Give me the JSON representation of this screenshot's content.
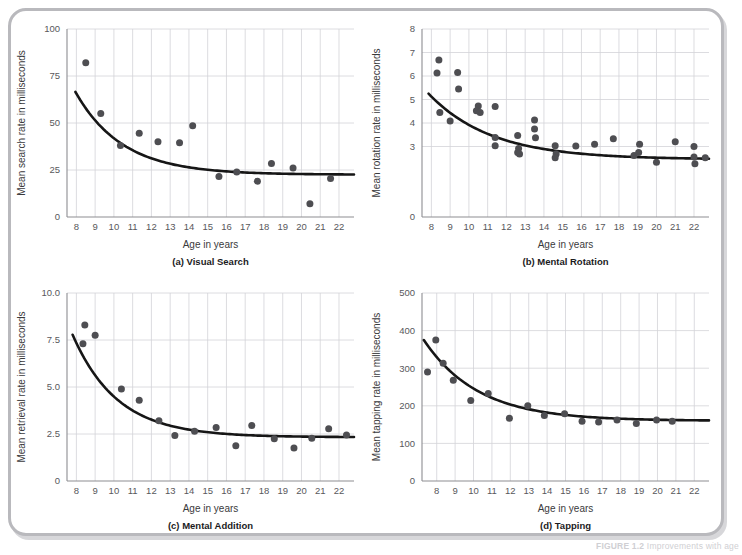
{
  "figure": {
    "caption_label": "FIGURE 1.2",
    "caption_rest": "  Improvements with age"
  },
  "common": {
    "xlabel": "Age in years",
    "xticks": [
      8,
      9,
      10,
      11,
      12,
      13,
      14,
      15,
      16,
      17,
      18,
      19,
      20,
      21,
      22
    ],
    "xlim": [
      7.5,
      22.8
    ]
  },
  "chart_data": [
    {
      "id": "visual-search",
      "type": "scatter",
      "title": "(a) Visual Search",
      "xlabel": "Age in years",
      "ylabel": "Mean search rate in milliseconds",
      "xlim": [
        7.5,
        22.8
      ],
      "ylim": [
        0,
        100
      ],
      "yticks": [
        0,
        25,
        50,
        75,
        100
      ],
      "ytick_labels": [
        "0",
        "25",
        "50",
        "75",
        "100"
      ],
      "grid": true,
      "points": [
        {
          "x": 8.5,
          "y": 82
        },
        {
          "x": 9.3,
          "y": 55
        },
        {
          "x": 10.35,
          "y": 38
        },
        {
          "x": 11.35,
          "y": 44.5
        },
        {
          "x": 12.35,
          "y": 40
        },
        {
          "x": 13.5,
          "y": 39.5
        },
        {
          "x": 14.2,
          "y": 48.5
        },
        {
          "x": 15.6,
          "y": 21.5
        },
        {
          "x": 16.55,
          "y": 24
        },
        {
          "x": 17.65,
          "y": 19
        },
        {
          "x": 18.4,
          "y": 28.5
        },
        {
          "x": 19.55,
          "y": 26
        },
        {
          "x": 20.45,
          "y": 7
        },
        {
          "x": 21.55,
          "y": 20.5
        }
      ],
      "fit": {
        "asymptote": 22.5,
        "amplitude": 44.0,
        "rate": 0.4,
        "x0": 7.95
      }
    },
    {
      "id": "mental-rotation",
      "type": "scatter",
      "title": "(b) Mental Rotation",
      "xlabel": "Age in years",
      "ylabel": "Mean rotation rate in milliseconds",
      "xlim": [
        7.5,
        22.8
      ],
      "ylim": [
        0,
        8
      ],
      "yticks": [
        0,
        3,
        4,
        5,
        6,
        7,
        8
      ],
      "ytick_labels": [
        "0",
        "3",
        "4",
        "5",
        "6",
        "7",
        "8"
      ],
      "grid": true,
      "points": [
        {
          "x": 8.4,
          "y": 6.68
        },
        {
          "x": 8.3,
          "y": 6.13
        },
        {
          "x": 9.4,
          "y": 6.15
        },
        {
          "x": 9.45,
          "y": 5.45
        },
        {
          "x": 8.45,
          "y": 4.45
        },
        {
          "x": 9.0,
          "y": 4.08
        },
        {
          "x": 10.5,
          "y": 4.72
        },
        {
          "x": 10.4,
          "y": 4.52
        },
        {
          "x": 10.6,
          "y": 4.45
        },
        {
          "x": 11.4,
          "y": 4.7
        },
        {
          "x": 11.4,
          "y": 3.38
        },
        {
          "x": 11.4,
          "y": 3.03
        },
        {
          "x": 12.6,
          "y": 3.47
        },
        {
          "x": 12.65,
          "y": 2.92
        },
        {
          "x": 12.6,
          "y": 2.75
        },
        {
          "x": 12.7,
          "y": 2.68
        },
        {
          "x": 13.5,
          "y": 4.13
        },
        {
          "x": 13.5,
          "y": 3.75
        },
        {
          "x": 13.55,
          "y": 3.37
        },
        {
          "x": 14.6,
          "y": 3.03
        },
        {
          "x": 14.65,
          "y": 2.68
        },
        {
          "x": 14.6,
          "y": 2.52
        },
        {
          "x": 15.7,
          "y": 3.02
        },
        {
          "x": 16.7,
          "y": 3.1
        },
        {
          "x": 17.7,
          "y": 3.33
        },
        {
          "x": 18.8,
          "y": 2.62
        },
        {
          "x": 19.05,
          "y": 2.75
        },
        {
          "x": 19.1,
          "y": 3.1
        },
        {
          "x": 20.0,
          "y": 2.33
        },
        {
          "x": 21.0,
          "y": 3.2
        },
        {
          "x": 22.0,
          "y": 3.0
        },
        {
          "x": 22.0,
          "y": 2.55
        },
        {
          "x": 22.05,
          "y": 2.27
        },
        {
          "x": 22.6,
          "y": 2.52
        }
      ],
      "fit": {
        "asymptote": 2.45,
        "amplitude": 2.8,
        "rate": 0.3,
        "x0": 7.85
      }
    },
    {
      "id": "mental-addition",
      "type": "scatter",
      "title": "(c) Mental Addition",
      "xlabel": "Age in years",
      "ylabel": "Mean retrieval rate in milliseconds",
      "xlim": [
        7.5,
        22.8
      ],
      "ylim": [
        0,
        10
      ],
      "yticks": [
        0,
        2.5,
        5.0,
        7.5,
        10.0
      ],
      "ytick_labels": [
        "0",
        "2.5",
        "5.0",
        "7.5",
        "10.0"
      ],
      "grid": true,
      "points": [
        {
          "x": 8.45,
          "y": 8.3
        },
        {
          "x": 8.35,
          "y": 7.3
        },
        {
          "x": 9.0,
          "y": 7.75
        },
        {
          "x": 10.4,
          "y": 4.9
        },
        {
          "x": 11.35,
          "y": 4.3
        },
        {
          "x": 12.4,
          "y": 3.2
        },
        {
          "x": 13.25,
          "y": 2.42
        },
        {
          "x": 14.3,
          "y": 2.65
        },
        {
          "x": 15.45,
          "y": 2.85
        },
        {
          "x": 16.5,
          "y": 1.88
        },
        {
          "x": 17.35,
          "y": 2.95
        },
        {
          "x": 18.55,
          "y": 2.25
        },
        {
          "x": 19.6,
          "y": 1.75
        },
        {
          "x": 20.55,
          "y": 2.27
        },
        {
          "x": 21.45,
          "y": 2.78
        },
        {
          "x": 22.4,
          "y": 2.45
        }
      ],
      "fit": {
        "asymptote": 2.33,
        "amplitude": 5.45,
        "rate": 0.42,
        "x0": 7.8
      }
    },
    {
      "id": "tapping",
      "type": "scatter",
      "title": "(d) Tapping",
      "xlabel": "Age in years",
      "ylabel": "Mean tapping rate in milliseconds",
      "xlim": [
        7.2,
        22.8
      ],
      "ylim": [
        0,
        500
      ],
      "yticks": [
        0,
        100,
        200,
        300,
        400,
        500
      ],
      "ytick_labels": [
        "0",
        "100",
        "200",
        "300",
        "400",
        "500"
      ],
      "grid": true,
      "points": [
        {
          "x": 7.5,
          "y": 290
        },
        {
          "x": 7.95,
          "y": 375
        },
        {
          "x": 8.35,
          "y": 313
        },
        {
          "x": 8.9,
          "y": 268
        },
        {
          "x": 9.85,
          "y": 214
        },
        {
          "x": 10.8,
          "y": 233
        },
        {
          "x": 11.95,
          "y": 167
        },
        {
          "x": 12.95,
          "y": 200
        },
        {
          "x": 13.85,
          "y": 174
        },
        {
          "x": 14.95,
          "y": 179
        },
        {
          "x": 15.9,
          "y": 159
        },
        {
          "x": 16.8,
          "y": 157
        },
        {
          "x": 17.8,
          "y": 162
        },
        {
          "x": 18.85,
          "y": 153
        },
        {
          "x": 19.95,
          "y": 162
        },
        {
          "x": 20.8,
          "y": 159
        }
      ],
      "fit": {
        "asymptote": 160,
        "amplitude": 215,
        "rate": 0.34,
        "x0": 7.3
      }
    }
  ]
}
